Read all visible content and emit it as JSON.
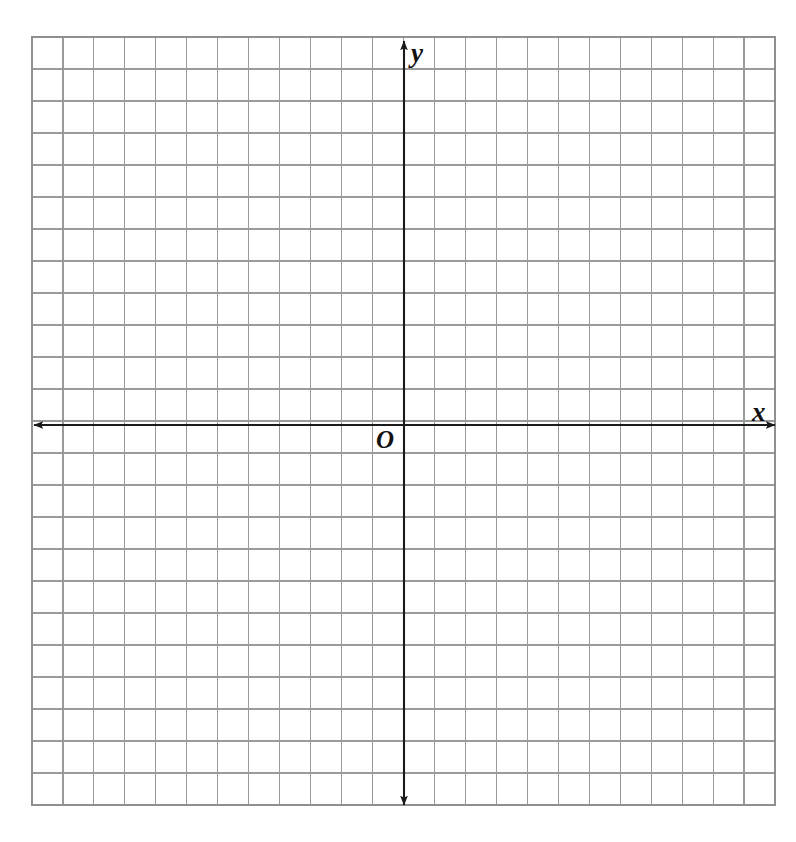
{
  "page": {
    "background_color": "#ffffff",
    "width": 796,
    "height": 842
  },
  "chart_data": {
    "type": "scatter",
    "title": "",
    "subtitle": "",
    "xlabel": "x",
    "ylabel": "y",
    "origin_label": "O",
    "grid": true,
    "grid_columns": 24,
    "grid_rows": 24,
    "cell_size_px": 30.96,
    "legend_position": "none",
    "annotations": [],
    "series": [
      {
        "name": "",
        "x": [],
        "y": [],
        "values": []
      }
    ],
    "x": [],
    "categories": [],
    "values": [],
    "xlim": [
      -12,
      12
    ],
    "ylim": [
      -12,
      12
    ],
    "xticks": [],
    "yticks": [],
    "xticklabels": [],
    "yticklabels": []
  },
  "geometry": {
    "grid_left": 32,
    "grid_top": 37,
    "grid_right": 775,
    "grid_bottom": 805,
    "x_axis_y": 425,
    "y_axis_x": 404,
    "x_arrow_left_end": 34,
    "x_arrow_right_end": 775,
    "y_arrow_top_end": 41,
    "y_arrow_bottom_end": 805
  },
  "colors": {
    "background": "#ffffff",
    "grid_line": "#9a9a9a",
    "grid_border": "#8f8f8f",
    "axis_line": "#1a1a1a",
    "label_text": "#111111"
  },
  "labels": {
    "y_axis": "y",
    "x_axis": "x",
    "origin": "O"
  }
}
